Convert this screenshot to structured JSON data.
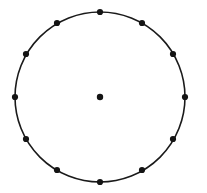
{
  "figure": {
    "name": "circle-with-twelve-points",
    "background_color": "#ffffff",
    "width": 207,
    "height": 193
  },
  "chart_data": {
    "type": "scatter",
    "title": "",
    "subtitle": "",
    "xlabel": "",
    "ylabel": "",
    "grid": false,
    "legend": null,
    "axes_visible": false,
    "tick_labels": [],
    "annotations": [],
    "xlim": [
      0,
      207
    ],
    "ylim": [
      0,
      193
    ],
    "circle": {
      "center_x": 100,
      "center_y": 97,
      "radius": 85,
      "stroke_color": "#1a1a1a",
      "stroke_width": 1.6,
      "fill": "none"
    },
    "point_style": {
      "marker": "filled-circle",
      "radius": 3.1,
      "color": "#141414"
    },
    "center_point_style": {
      "marker": "filled-circle",
      "radius": 3.2,
      "color": "#141414"
    },
    "point_count_on_circle": 12,
    "angular_spacing_degrees": 30,
    "series": [
      {
        "name": "circumference-points",
        "values": [
          {
            "label": "p0",
            "angle_deg": 0,
            "x": 185,
            "y": 97
          },
          {
            "label": "p1",
            "angle_deg": 30,
            "x": 173,
            "y": 54
          },
          {
            "label": "p2",
            "angle_deg": 60,
            "x": 142,
            "y": 23
          },
          {
            "label": "p3",
            "angle_deg": 90,
            "x": 100,
            "y": 12
          },
          {
            "label": "p4",
            "angle_deg": 120,
            "x": 57,
            "y": 23
          },
          {
            "label": "p5",
            "angle_deg": 150,
            "x": 26,
            "y": 54
          },
          {
            "label": "p6",
            "angle_deg": 180,
            "x": 15,
            "y": 97
          },
          {
            "label": "p7",
            "angle_deg": 210,
            "x": 26,
            "y": 139
          },
          {
            "label": "p8",
            "angle_deg": 240,
            "x": 57,
            "y": 170
          },
          {
            "label": "p9",
            "angle_deg": 270,
            "x": 100,
            "y": 182
          },
          {
            "label": "p10",
            "angle_deg": 300,
            "x": 142,
            "y": 170
          },
          {
            "label": "p11",
            "angle_deg": 330,
            "x": 173,
            "y": 139
          }
        ]
      },
      {
        "name": "center-point",
        "values": [
          {
            "label": "center",
            "x": 100,
            "y": 97
          }
        ]
      }
    ]
  }
}
